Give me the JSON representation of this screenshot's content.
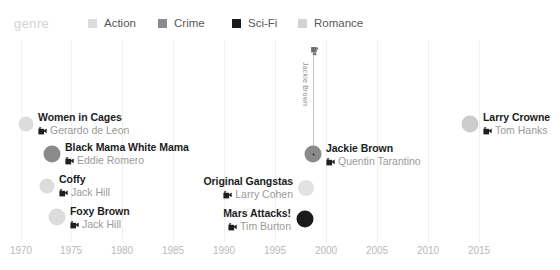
{
  "legend": {
    "title": "genre",
    "items": [
      {
        "label": "Action",
        "color": "#dcdcdc",
        "x": 88
      },
      {
        "label": "Crime",
        "color": "#8a8a8a",
        "x": 158
      },
      {
        "label": "Sci-Fi",
        "color": "#1b1b1b",
        "x": 232
      },
      {
        "label": "Romance",
        "color": "#d2d2d2",
        "x": 298
      }
    ]
  },
  "axis": {
    "ticks": [
      {
        "label": "1970",
        "x": 21
      },
      {
        "label": "1975",
        "x": 71
      },
      {
        "label": "1980",
        "x": 122
      },
      {
        "label": "1985",
        "x": 173
      },
      {
        "label": "1990",
        "x": 224
      },
      {
        "label": "1995",
        "x": 275
      },
      {
        "label": "2000",
        "x": 326
      },
      {
        "label": "2005",
        "x": 377
      },
      {
        "label": "2010",
        "x": 428
      },
      {
        "label": "2015",
        "x": 479
      }
    ]
  },
  "leader": {
    "label": "Jackie Brown",
    "line_x": 313,
    "line_top": 47,
    "line_height": 105,
    "label_x": 309,
    "label_y": 62,
    "cam_x": 310,
    "cam_y": 47
  },
  "chart_data": {
    "type": "scatter",
    "title": "",
    "xlabel": "",
    "ylabel": "",
    "xlim": [
      1970,
      2015
    ],
    "grid": true,
    "legend_position": "top",
    "points": [
      {
        "film": "Women in Cages",
        "director": "Gerardo de Leon",
        "year": 1971,
        "genre": "Romance",
        "color": "#dcdcdc",
        "size": 15,
        "cx": 26,
        "cy": 124,
        "label_side": "right",
        "label_x": 38,
        "label_y": 111,
        "highlighted": false
      },
      {
        "film": "Black Mama White Mama",
        "director": "Eddie Romero",
        "year": 1973,
        "genre": "Crime",
        "color": "#8a8a8a",
        "size": 17,
        "cx": 52,
        "cy": 154,
        "label_side": "right",
        "label_x": 65,
        "label_y": 141,
        "highlighted": false
      },
      {
        "film": "Coffy",
        "director": "Jack Hill",
        "year": 1973,
        "genre": "Action",
        "color": "#dcdcdc",
        "size": 15,
        "cx": 47,
        "cy": 186,
        "label_side": "right",
        "label_x": 59,
        "label_y": 173,
        "highlighted": false
      },
      {
        "film": "Foxy Brown",
        "director": "Jack Hill",
        "year": 1974,
        "genre": "Action",
        "color": "#dcdcdc",
        "size": 17,
        "cx": 57,
        "cy": 217,
        "label_side": "right",
        "label_x": 70,
        "label_y": 205,
        "highlighted": false
      },
      {
        "film": "Original Gangstas",
        "director": "Larry Cohen",
        "year": 1996,
        "genre": "Action",
        "color": "#e2e2e2",
        "size": 16,
        "cx": 306,
        "cy": 188,
        "label_side": "left",
        "label_x": 293,
        "label_y": 175,
        "highlighted": false
      },
      {
        "film": "Mars Attacks!",
        "director": "Tim Burton",
        "year": 1996,
        "genre": "Sci-Fi",
        "color": "#1b1b1b",
        "size": 17,
        "cx": 305,
        "cy": 219,
        "label_side": "left",
        "label_x": 291,
        "label_y": 207,
        "highlighted": false
      },
      {
        "film": "Jackie Brown",
        "director": "Quentin Tarantino",
        "year": 1997,
        "genre": "Crime",
        "color": "#8a8a8a",
        "size": 17,
        "cx": 313,
        "cy": 154,
        "label_side": "right",
        "label_x": 326,
        "label_y": 142,
        "highlighted": true
      },
      {
        "film": "Larry Crowne",
        "director": "Tom Hanks",
        "year": 2011,
        "genre": "Romance",
        "color": "#cccccc",
        "size": 17,
        "cx": 470,
        "cy": 124,
        "label_side": "right",
        "label_x": 483,
        "label_y": 111,
        "highlighted": false
      }
    ]
  }
}
